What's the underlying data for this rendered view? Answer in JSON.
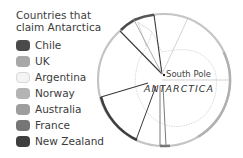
{
  "legend": {
    "title_line1": "Countries that",
    "title_line2": "claim Antarctica",
    "items": [
      {
        "label": "Chile",
        "color": "#4a4a4a"
      },
      {
        "label": "UK",
        "color": "#a8a8a8"
      },
      {
        "label": "Argentina",
        "color": "#f4f4f4"
      },
      {
        "label": "Norway",
        "color": "#b4b4b4"
      },
      {
        "label": "Australia",
        "color": "#9e9e9e"
      },
      {
        "label": "France",
        "color": "#767676"
      },
      {
        "label": "New Zealand",
        "color": "#3e3e3e"
      }
    ]
  },
  "map": {
    "pole_label": "South Pole",
    "continent_label": "ANTARCTICA"
  }
}
